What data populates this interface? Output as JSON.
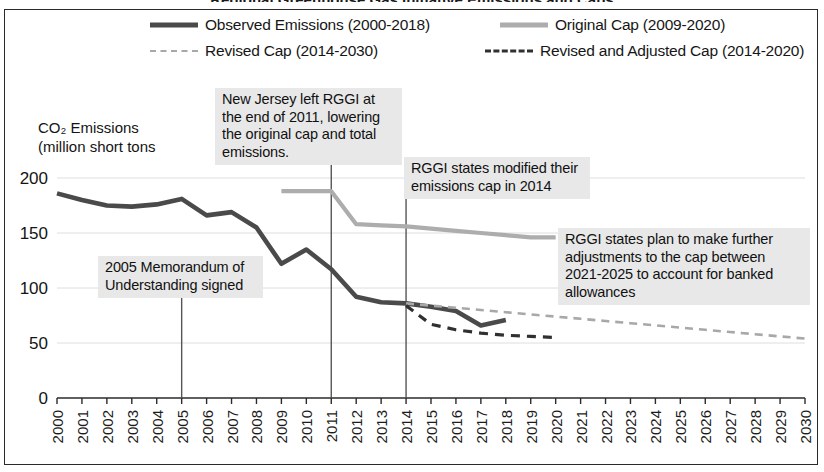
{
  "figure": {
    "cut_off_title": "Regional Greenhouse Gas Initiative Emissions and Caps",
    "background_color": "#ffffff",
    "border_color": "#2a2a2a"
  },
  "legend": {
    "position": "top",
    "items": [
      {
        "label": "Observed Emissions (2000-2018)",
        "style": "solid",
        "color": "#4a4a4a",
        "icon": "line-swatch-solid-dark-icon"
      },
      {
        "label": "Revised Cap (2014-2030)",
        "style": "dashed",
        "color": "#a8a8a8",
        "icon": "line-swatch-dashed-gray-icon"
      },
      {
        "label": "Original Cap (2009-2020)",
        "style": "solid",
        "color": "#adadad",
        "icon": "line-swatch-solid-gray-icon"
      },
      {
        "label": "Revised and Adjusted Cap (2014-2020)",
        "style": "dashed",
        "color": "#303030",
        "icon": "line-swatch-dashed-dark-icon"
      }
    ]
  },
  "axis_title": "CO₂ Emissions\n(million short tons",
  "annotations": [
    {
      "id": "nj",
      "text": "New Jersey left RGGI at the end of 2011, lowering the original cap and total emissions.",
      "anchor_year": 2011
    },
    {
      "id": "modified",
      "text": "RGGI states modified their emissions cap in 2014",
      "anchor_year": 2014
    },
    {
      "id": "future",
      "text": "RGGI states plan to make further adjustments to the cap between 2021-2025 to account for banked allowances",
      "anchor_year": null
    },
    {
      "id": "mou",
      "text": "2005 Memorandum of Understanding signed",
      "anchor_year": 2005
    }
  ],
  "chart_data": {
    "type": "line",
    "title": "Regional Greenhouse Gas Initiative Emissions and Caps",
    "xlabel": "",
    "ylabel": "CO₂ Emissions (million short tons",
    "xlim": [
      2000,
      2030
    ],
    "ylim": [
      0,
      210
    ],
    "yticks": [
      0,
      50,
      100,
      150,
      200
    ],
    "xticks": [
      2000,
      2001,
      2002,
      2003,
      2004,
      2005,
      2006,
      2007,
      2008,
      2009,
      2010,
      2011,
      2012,
      2013,
      2014,
      2015,
      2016,
      2017,
      2018,
      2019,
      2020,
      2021,
      2022,
      2023,
      2024,
      2025,
      2026,
      2027,
      2028,
      2029,
      2030
    ],
    "grid": "horizontal-light",
    "legend_position": "top",
    "series": [
      {
        "name": "Observed Emissions (2000-2018)",
        "style": "solid",
        "color": "#4a4a4a",
        "x": [
          2000,
          2001,
          2002,
          2003,
          2004,
          2005,
          2006,
          2007,
          2008,
          2009,
          2010,
          2011,
          2012,
          2013,
          2014,
          2015,
          2016,
          2017,
          2018
        ],
        "y": [
          186,
          180,
          175,
          174,
          176,
          181,
          166,
          169,
          155,
          122,
          135,
          117,
          92,
          87,
          86,
          83,
          79,
          66,
          71
        ]
      },
      {
        "name": "Original Cap (2009-2020)",
        "style": "solid",
        "color": "#adadad",
        "x": [
          2009,
          2010,
          2011,
          2012,
          2013,
          2014,
          2015,
          2016,
          2017,
          2018,
          2019,
          2020
        ],
        "y": [
          188,
          188,
          188,
          158,
          157,
          156,
          154,
          152,
          150,
          148,
          146,
          146
        ]
      },
      {
        "name": "Revised Cap (2014-2030)",
        "style": "dashed",
        "color": "#a8a8a8",
        "x": [
          2014,
          2015,
          2016,
          2017,
          2018,
          2019,
          2020,
          2021,
          2022,
          2023,
          2024,
          2025,
          2026,
          2027,
          2028,
          2029,
          2030
        ],
        "y": [
          86,
          84,
          82,
          80,
          78,
          76,
          74,
          72,
          70,
          68,
          66,
          64,
          62,
          60,
          58,
          56,
          54
        ]
      },
      {
        "name": "Revised and Adjusted Cap (2014-2020)",
        "style": "dashed",
        "color": "#303030",
        "x": [
          2014,
          2015,
          2016,
          2017,
          2018,
          2019,
          2020
        ],
        "y": [
          84,
          67,
          62,
          59,
          57,
          56,
          55
        ]
      }
    ]
  }
}
